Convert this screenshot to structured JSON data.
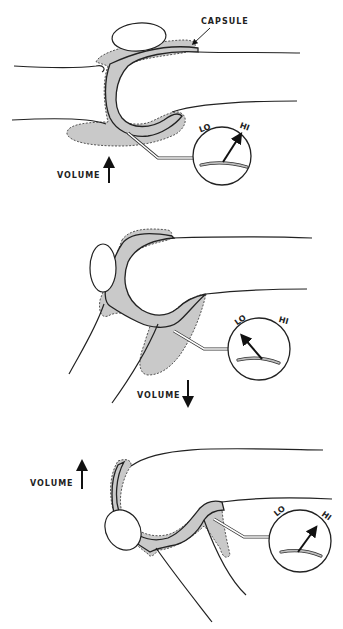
{
  "figure": {
    "panels": [
      {
        "id": "extended",
        "volume_label": "VOLUME",
        "volume_direction": "up",
        "capsule_label": "CAPSULE",
        "gauge": {
          "lo_label": "LO",
          "hi_label": "HI",
          "reading": "HI"
        }
      },
      {
        "id": "flexed-moderate",
        "volume_label": "VOLUME",
        "volume_direction": "down",
        "gauge": {
          "lo_label": "LO",
          "hi_label": "HI",
          "reading": "LO"
        }
      },
      {
        "id": "flexed-full",
        "volume_label": "VOLUME",
        "volume_direction": "up",
        "gauge": {
          "lo_label": "LO",
          "hi_label": "HI",
          "reading": "HI"
        }
      }
    ],
    "colors": {
      "line": "#222222",
      "capsule_fill": "#c9c9c9",
      "background": "#ffffff"
    }
  }
}
